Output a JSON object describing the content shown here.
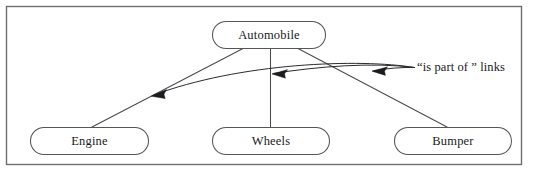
{
  "figure": {
    "kind": "semantic-network-diagram",
    "frame": {
      "visible": true,
      "color": "#6e6e73"
    },
    "background_color": "#ffffff",
    "line_color": "#4a4a4f",
    "text_color": "#1a1a1a"
  },
  "nodes": [
    {
      "id": "automobile",
      "label": "Automobile",
      "role": "parent-concept"
    },
    {
      "id": "engine",
      "label": "Engine",
      "role": "child-concept"
    },
    {
      "id": "wheels",
      "label": "Wheels",
      "role": "child-concept"
    },
    {
      "id": "bumper",
      "label": "Bumper",
      "role": "child-concept"
    }
  ],
  "edges": [
    {
      "from": "automobile",
      "to": "engine",
      "relation": "is part of"
    },
    {
      "from": "automobile",
      "to": "wheels",
      "relation": "is part of"
    },
    {
      "from": "automobile",
      "to": "bumper",
      "relation": "is part of"
    }
  ],
  "annotation": {
    "label": "“is part of ” links",
    "pointer_count": 3,
    "arrow_color": "#1c1c20"
  }
}
